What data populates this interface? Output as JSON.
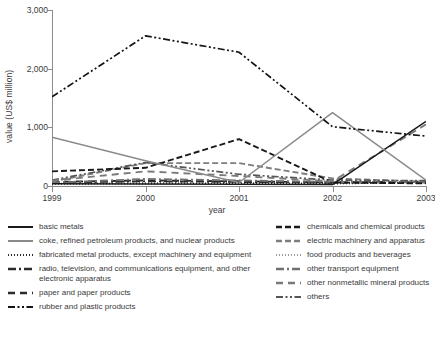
{
  "chart_data": {
    "type": "line",
    "title": "",
    "xlabel": "year",
    "ylabel": "value (US$ million)",
    "x": [
      "1999",
      "2000",
      "2001",
      "2002",
      "2003"
    ],
    "xtick_labels": [
      "1999",
      "2000",
      "2001",
      "2002",
      "2003"
    ],
    "ytick_labels": [
      "0",
      "1,000",
      "2,000",
      "3,000"
    ],
    "ytick_values": [
      0,
      1000,
      2000,
      3000
    ],
    "ylim": [
      0,
      3000
    ],
    "grid": false,
    "legend_position": "below",
    "series": [
      {
        "name": "basic metals",
        "color": "#1a1a1a",
        "dash": "solid",
        "values": [
          40,
          35,
          30,
          25,
          1100
        ]
      },
      {
        "name": "coke, refined petroleum products, and nuclear products",
        "color": "#8a8a8a",
        "dash": "solid",
        "values": [
          830,
          430,
          60,
          1250,
          100
        ]
      },
      {
        "name": "fabricated metal products, except machinery and equipment",
        "color": "#2b2b2b",
        "dash": "dotted",
        "values": [
          35,
          40,
          45,
          40,
          60
        ]
      },
      {
        "name": "radio, television, and communications equipment, and other electronic apparatus",
        "color": "#2b2b2b",
        "dash": "dashdot",
        "values": [
          60,
          80,
          70,
          55,
          70
        ]
      },
      {
        "name": "paper and paper products",
        "color": "#2b2b2b",
        "dash": "longdash",
        "values": [
          70,
          95,
          80,
          60,
          75
        ]
      },
      {
        "name": "rubber and plastic products",
        "color": "#141414",
        "dash": "dashdotdot",
        "values": [
          1520,
          2560,
          2280,
          1010,
          850
        ]
      },
      {
        "name": "chemicals and chemical products",
        "color": "#1a1a1a",
        "dash": "dashed",
        "values": [
          250,
          310,
          800,
          60,
          45
        ]
      },
      {
        "name": "electric machinery and apparatus",
        "color": "#7e7e7e",
        "dash": "dashed",
        "values": [
          75,
          390,
          390,
          130,
          70
        ]
      },
      {
        "name": "food products and beverages",
        "color": "#9a9a9a",
        "dash": "dotted",
        "values": [
          45,
          55,
          50,
          45,
          55
        ]
      },
      {
        "name": "other transport equipment",
        "color": "#6f6f6f",
        "dash": "dashdot",
        "values": [
          55,
          120,
          95,
          70,
          60
        ]
      },
      {
        "name": "other nonmetallic mineral products",
        "color": "#7a7a7a",
        "dash": "longdash",
        "values": [
          90,
          250,
          170,
          80,
          1050
        ]
      },
      {
        "name": "others",
        "color": "#555555",
        "dash": "dashdotdot",
        "values": [
          100,
          400,
          200,
          100,
          90
        ]
      }
    ]
  },
  "legend": {
    "left_column": [
      {
        "label": "basic metals",
        "series_index": 0
      },
      {
        "label": "coke, refined petroleum products, and nuclear products",
        "series_index": 1
      },
      {
        "label": "fabricated metal products, except machinery and equipment",
        "series_index": 2
      },
      {
        "label": "radio, television, and communications equipment, and other",
        "continuation": "electronic apparatus",
        "series_index": 3
      },
      {
        "label": "paper and paper products",
        "series_index": 4
      },
      {
        "label": "rubber and plastic products",
        "series_index": 5
      }
    ],
    "right_column": [
      {
        "label": "chemicals and chemical products",
        "series_index": 6
      },
      {
        "label": "electric machinery and apparatus",
        "series_index": 7
      },
      {
        "label": "food products and beverages",
        "series_index": 8
      },
      {
        "label": "other transport equipment",
        "series_index": 9
      },
      {
        "label": "other nonmetallic mineral products",
        "series_index": 10
      },
      {
        "label": "others",
        "series_index": 11
      }
    ]
  },
  "source_note": ""
}
